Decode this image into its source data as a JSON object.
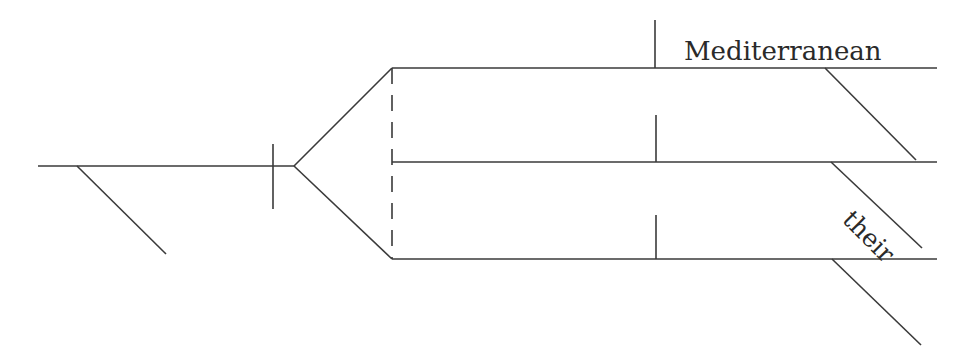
{
  "diagram": {
    "type": "sentence-diagram",
    "words": {
      "mediterranean": "Mediterranean",
      "their": "their"
    },
    "colors": {
      "line": "#3a3a3a",
      "text": "#2a2a2a",
      "background": "#ffffff"
    },
    "lines": {
      "subject_baseline": {
        "x1": 38,
        "y1": 166,
        "x2": 294,
        "y2": 166
      },
      "subject_modifier": {
        "x1": 77,
        "y1": 166,
        "x2": 166,
        "y2": 254
      },
      "subject_predicate_divider": {
        "x1": 273,
        "y1": 144,
        "x2": 273,
        "y2": 209
      },
      "fork_upper": {
        "x1": 294,
        "y1": 166,
        "x2": 392,
        "y2": 68
      },
      "fork_lower": {
        "x1": 294,
        "y1": 166,
        "x2": 392,
        "y2": 259
      },
      "compound_connector": {
        "x1": 392,
        "y1": 68,
        "x2": 392,
        "y2": 259
      },
      "predicate_top": {
        "x1": 392,
        "y1": 68,
        "x2": 937,
        "y2": 68
      },
      "predicate_middle": {
        "x1": 392,
        "y1": 162,
        "x2": 937,
        "y2": 162
      },
      "predicate_bottom": {
        "x1": 392,
        "y1": 259,
        "x2": 937,
        "y2": 259
      },
      "object_divider_top": {
        "x1": 655,
        "y1": 20,
        "x2": 655,
        "y2": 68
      },
      "object_divider_middle": {
        "x1": 656,
        "y1": 115,
        "x2": 656,
        "y2": 162
      },
      "object_divider_bottom": {
        "x1": 656,
        "y1": 215,
        "x2": 656,
        "y2": 259
      },
      "modifier_top": {
        "x1": 825,
        "y1": 68,
        "x2": 916,
        "y2": 160
      },
      "modifier_middle": {
        "x1": 831,
        "y1": 162,
        "x2": 922,
        "y2": 248
      },
      "modifier_bottom": {
        "x1": 832,
        "y1": 259,
        "x2": 921,
        "y2": 345
      }
    }
  }
}
